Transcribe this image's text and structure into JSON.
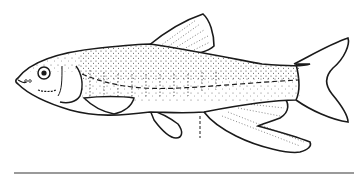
{
  "illustration": {
    "subject": "fish line drawing (minnow, lateral view, facing left)",
    "colors": {
      "background": "#ffffff",
      "ink": "#1a1a1a",
      "rule": "#9a9a9a"
    }
  }
}
